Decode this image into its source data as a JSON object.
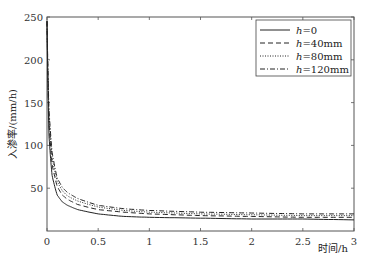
{
  "chart_data": {
    "type": "line",
    "title": "",
    "xlabel": "时间/h",
    "ylabel": "入渗率/(mm/h)",
    "xlim": [
      0,
      3
    ],
    "ylim": [
      0,
      250
    ],
    "xticks": [
      "0",
      "0.5",
      "1",
      "1.5",
      "2",
      "2.5",
      "3"
    ],
    "yticks": [
      "50",
      "100",
      "150",
      "200",
      "250"
    ],
    "grid": false,
    "legend_position": "upper right",
    "x": [
      0.0,
      0.02,
      0.05,
      0.1,
      0.15,
      0.2,
      0.3,
      0.5,
      0.75,
      1.0,
      1.5,
      2.0,
      2.5,
      3.0
    ],
    "series": [
      {
        "name": "h=0",
        "legend_var": "h",
        "legend_val": "=0",
        "style": "solid",
        "values": [
          245,
          110,
          65,
          42,
          34,
          30,
          25,
          20,
          17,
          16,
          15,
          14,
          14,
          13
        ]
      },
      {
        "name": "h=40mm",
        "legend_var": "h",
        "legend_val": "=40mm",
        "style": "dashed",
        "values": [
          245,
          125,
          78,
          52,
          42,
          37,
          31,
          25,
          22,
          20,
          18,
          17,
          16,
          16
        ]
      },
      {
        "name": "h=80mm",
        "legend_var": "h",
        "legend_val": "=80mm",
        "style": "dotted",
        "values": [
          245,
          135,
          86,
          58,
          47,
          41,
          35,
          28,
          24,
          22,
          20,
          19,
          18,
          18
        ]
      },
      {
        "name": "h=120mm",
        "legend_var": "h",
        "legend_val": "=120mm",
        "style": "dashdot",
        "values": [
          245,
          140,
          92,
          62,
          51,
          45,
          38,
          30,
          26,
          24,
          22,
          21,
          20,
          20
        ]
      }
    ]
  }
}
